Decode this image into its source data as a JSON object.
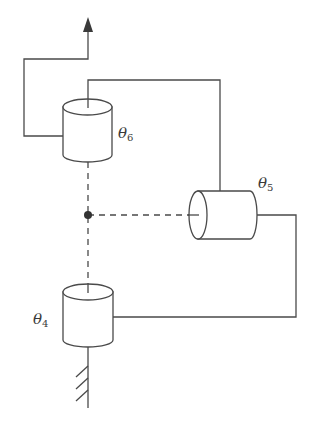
{
  "diagram": {
    "colors": {
      "line": "#4a4a4a",
      "text": "#3a3a3a",
      "background": "#ffffff",
      "center_point": "#333333"
    },
    "joints": [
      {
        "id": "theta4",
        "symbol": "θ",
        "subscript": "4",
        "orientation": "vertical",
        "position": "bottom"
      },
      {
        "id": "theta5",
        "symbol": "θ",
        "subscript": "5",
        "orientation": "horizontal",
        "position": "right"
      },
      {
        "id": "theta6",
        "symbol": "θ",
        "subscript": "6",
        "orientation": "vertical",
        "position": "top"
      }
    ],
    "elements": {
      "base": "fixed ground (hatched)",
      "end_effector": "arrow pointing up",
      "wrist_center": "dot at intersection of joint axes"
    }
  }
}
